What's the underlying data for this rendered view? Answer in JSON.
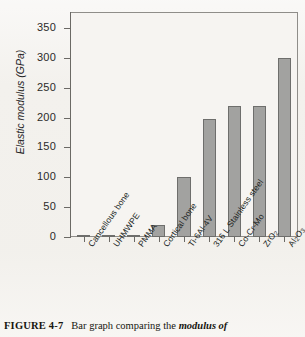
{
  "figure": {
    "caption_label": "FIGURE 4-7",
    "caption_text": "Bar graph comparing the ",
    "caption_emphasis": "modulus of"
  },
  "axes": {
    "y_label": "Elastic modulus (GPa)",
    "y_ticks": [
      "0",
      "50",
      "100",
      "150",
      "200",
      "250",
      "300",
      "350"
    ],
    "y_min": 0,
    "y_max": 375
  },
  "colors": {
    "bar_fill": "#a2a2a0",
    "bar_stroke": "#6e6e6c",
    "frame": "#8f8d89",
    "paper": "#f3f1ed",
    "text": "#201f1d"
  },
  "chart_data": {
    "type": "bar",
    "title": "",
    "xlabel": "",
    "ylabel": "Elastic modulus (GPa)",
    "ylim": [
      0,
      375
    ],
    "yticks": [
      0,
      50,
      100,
      150,
      200,
      250,
      300,
      350
    ],
    "grid": false,
    "legend": "none",
    "categories": [
      "Cancellous bone",
      "UHMWPE",
      "PMMA",
      "Cortical bone",
      "Ti-6Al-4V",
      "316 L Stainless steel",
      "Co-Cr-Mo",
      "ZrO2",
      "Al2O3"
    ],
    "category_labels_html": [
      "Cancellous bone",
      "UHMWPE",
      "PMMA",
      "Cortical bone",
      "Ti-6Al-4V",
      "316 L Stainless steel",
      "Co-Cr-Mo",
      "ZrO₂",
      "Al₂O₃"
    ],
    "values": [
      1,
      1,
      2,
      20,
      100,
      198,
      220,
      220,
      300
    ],
    "units": "GPa"
  }
}
